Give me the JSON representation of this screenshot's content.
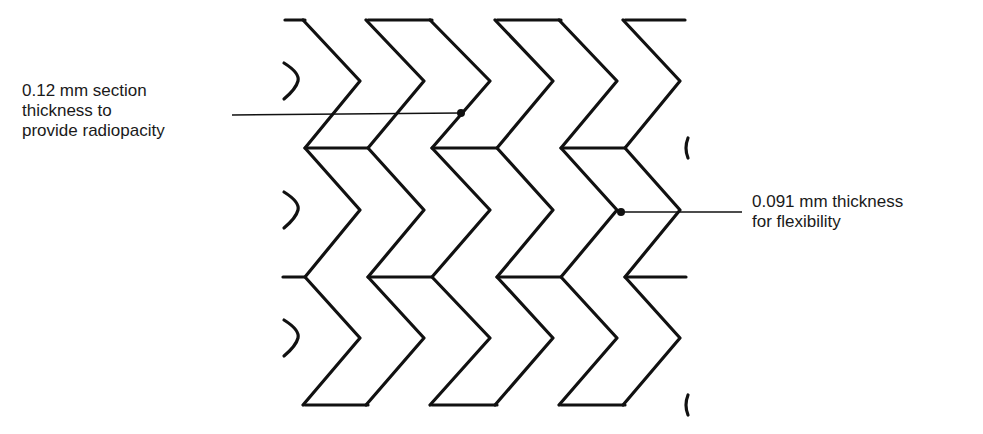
{
  "diagram": {
    "annotations": [
      {
        "id": "radiopacity",
        "lines": [
          "0.12 mm section",
          "thickness to",
          "provide radiopacity"
        ],
        "text": "0.12 mm section\nthickness to\nprovide radiopacity"
      },
      {
        "id": "flexibility",
        "lines": [
          "0.091 mm thickness",
          "for flexibility"
        ],
        "text": "0.091 mm thickness\nfor flexibility"
      }
    ],
    "colors": {
      "stroke": "#111111",
      "background": "#ffffff",
      "text": "#1a1a1a"
    }
  }
}
